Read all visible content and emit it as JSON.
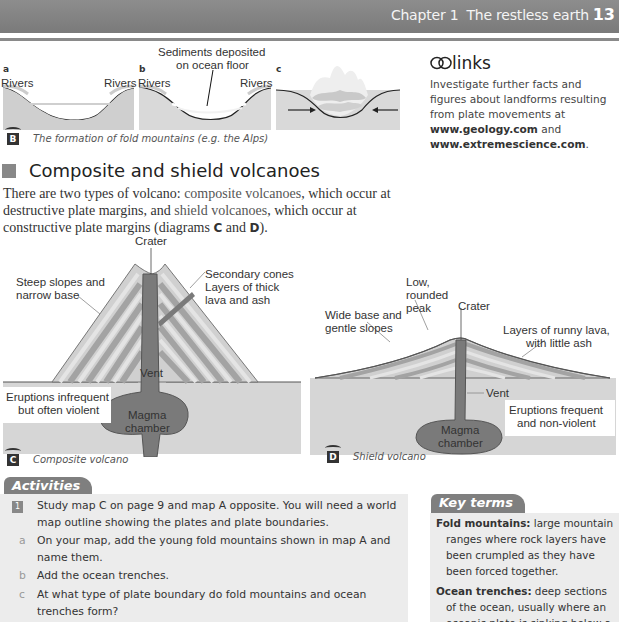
{
  "header": {
    "chapter": "Chapter 1",
    "title": "The restless earth",
    "page_number": "13"
  },
  "figure_b": {
    "panels": [
      {
        "letter": "a",
        "labels": [
          "Rivers",
          "Rivers"
        ]
      },
      {
        "letter": "b",
        "labels": [
          "Rivers",
          "Rivers"
        ],
        "annotation": "Sediments deposited on ocean floor",
        "annotation_lines": [
          "Sediments deposited",
          "on ocean floor"
        ]
      },
      {
        "letter": "c",
        "labels": []
      }
    ],
    "badge": "B",
    "caption": "The formation of fold mountains (e.g. the Alps)"
  },
  "links": {
    "title": "links",
    "text_before": "Investigate further facts and figures about landforms resulting from plate movements at ",
    "url1": "www.geology.com",
    "url1_part1": "www.geology.",
    "url1_part2": "com",
    "text_middle": " and ",
    "url2": "www.extremescience.com",
    "text_after": "."
  },
  "section": {
    "heading": "Composite and shield volcanoes",
    "paragraph": {
      "p1": "There are two types of volcano: ",
      "term1": "composite volcanoes",
      "p2": ", which occur at destructive plate margins, and ",
      "term2": "shield volcanoes",
      "p3": ", which occur at constructive plate margins (diagrams ",
      "ref1": "C",
      "p4": " and ",
      "ref2": "D",
      "p5": ")."
    }
  },
  "figure_c": {
    "badge": "C",
    "caption": "Composite volcano",
    "labels": {
      "crater": "Crater",
      "slopes_1": "Steep slopes and",
      "slopes_2": "narrow base",
      "secondary_cones": "Secondary cones",
      "layers_1": "Layers of thick",
      "layers_2": "lava and ash",
      "vent": "Vent",
      "eruptions_1": "Eruptions infrequent",
      "eruptions_2": "but often violent",
      "magma_1": "Magma",
      "magma_2": "chamber"
    }
  },
  "figure_d": {
    "badge": "D",
    "caption": "Shield volcano",
    "labels": {
      "peak_1": "Low,",
      "peak_2": "rounded",
      "peak_3": "peak",
      "crater": "Crater",
      "base_1": "Wide base and",
      "base_2": "gentle slopes",
      "layers_1": "Layers of runny lava,",
      "layers_2": "with little ash",
      "vent": "Vent",
      "eruptions_1": "Eruptions frequent",
      "eruptions_2": "and non-violent",
      "magma_1": "Magma",
      "magma_2": "chamber"
    }
  },
  "activities": {
    "tab_label": "Activities",
    "items": [
      {
        "number": "1",
        "text_line1": "Study map C on page 9 and map A opposite. You will need a world",
        "text_line2": "map outline showing the plates and plate boundaries.",
        "subitems": [
          {
            "letter": "a",
            "line1": "On your map, add the young fold mountains shown in map A and",
            "line2": "name them."
          },
          {
            "letter": "b",
            "line1": "Add the ocean trenches.",
            "line2": ""
          },
          {
            "letter": "c",
            "line1": "At what type of plate boundary do fold mountains and ocean",
            "line2": "trenches form?"
          }
        ]
      }
    ]
  },
  "key_terms": {
    "tab_label": "Key terms",
    "items": [
      {
        "term": "Fold mountains:",
        "definition": " large mountain ranges where rock layers have been crumpled as they have been forced together."
      },
      {
        "term": "Ocean trenches:",
        "definition": " deep sections of the ocean, usually where an oceanic plate is sinking below a"
      }
    ]
  },
  "colors": {
    "header_bg": "#808080",
    "diagram_ground": "#d6d6d6",
    "magma": "#777777",
    "layer_dark": "#a8a8a8",
    "layer_light": "#e0e0e0",
    "box_bg": "#ececec"
  }
}
